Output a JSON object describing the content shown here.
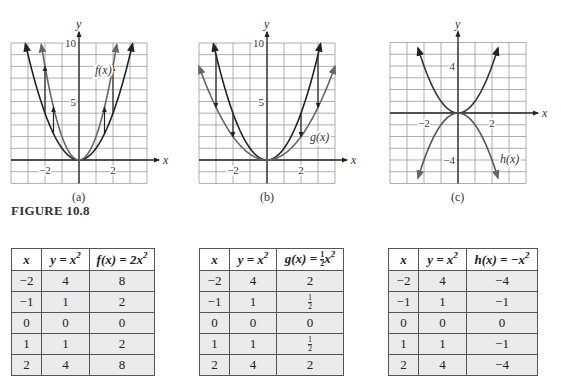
{
  "figure_label": "FIGURE 10.8",
  "captions": {
    "a": "(a)",
    "b": "(b)",
    "c": "(c)"
  },
  "graphs": {
    "a": {
      "x_axis_label": "x",
      "y_axis_label": "y",
      "x_ticks": [
        "−2",
        "2"
      ],
      "y_ticks": [
        "5",
        "10"
      ],
      "curve_label": "f(x)"
    },
    "b": {
      "x_axis_label": "x",
      "y_axis_label": "y",
      "x_ticks": [
        "−2",
        "2"
      ],
      "y_ticks": [
        "5",
        "10"
      ],
      "curve_label": "g(x)"
    },
    "c": {
      "x_axis_label": "x",
      "y_axis_label": "y",
      "x_ticks": [
        "−2",
        "2"
      ],
      "y_ticks": [
        "4",
        "−4"
      ],
      "curve_label": "h(x)"
    }
  },
  "tables": {
    "a": {
      "headers": [
        "x",
        "y = x²",
        "f(x) = 2x²"
      ],
      "rows": [
        [
          "−2",
          "4",
          "8"
        ],
        [
          "−1",
          "1",
          "2"
        ],
        [
          "0",
          "0",
          "0"
        ],
        [
          "1",
          "1",
          "2"
        ],
        [
          "2",
          "4",
          "8"
        ]
      ]
    },
    "b": {
      "headers": [
        "x",
        "y = x²",
        "g(x) = ½x²"
      ],
      "rows": [
        [
          "−2",
          "4",
          "2"
        ],
        [
          "−1",
          "1",
          "½"
        ],
        [
          "0",
          "0",
          "0"
        ],
        [
          "1",
          "1",
          "½"
        ],
        [
          "2",
          "4",
          "2"
        ]
      ]
    },
    "c": {
      "headers": [
        "x",
        "y = x²",
        "h(x) = −x²"
      ],
      "rows": [
        [
          "−2",
          "4",
          "−4"
        ],
        [
          "−1",
          "1",
          "−1"
        ],
        [
          "0",
          "0",
          "0"
        ],
        [
          "1",
          "1",
          "−1"
        ],
        [
          "2",
          "4",
          "−4"
        ]
      ]
    }
  },
  "chart_data": [
    {
      "type": "line",
      "title": "(a)",
      "xlabel": "x",
      "ylabel": "y",
      "xlim": [
        -4,
        4
      ],
      "ylim": [
        -2,
        10
      ],
      "grid": true,
      "series": [
        {
          "name": "y = x^2",
          "x": [
            -3.2,
            -3,
            -2,
            -1,
            0,
            1,
            2,
            3,
            3.2
          ],
          "values": [
            10.24,
            9,
            4,
            1,
            0,
            1,
            4,
            9,
            10.24
          ]
        },
        {
          "name": "f(x) = 2x^2",
          "x": [
            -2.24,
            -2,
            -1,
            0,
            1,
            2,
            2.24
          ],
          "values": [
            10,
            8,
            2,
            0,
            2,
            8,
            10
          ]
        }
      ],
      "annotations": [
        "f(x)",
        "arrows from y=x^2 up to 2x^2 at x=±1 and x=±2"
      ]
    },
    {
      "type": "line",
      "title": "(b)",
      "xlabel": "x",
      "ylabel": "y",
      "xlim": [
        -4,
        4
      ],
      "ylim": [
        -2,
        10
      ],
      "grid": true,
      "series": [
        {
          "name": "y = x^2",
          "x": [
            -3.1,
            -3,
            -2,
            -1,
            0,
            1,
            2,
            3,
            3.1
          ],
          "values": [
            9.6,
            9,
            4,
            1,
            0,
            1,
            4,
            9,
            9.6
          ]
        },
        {
          "name": "g(x) = 1/2 x^2",
          "x": [
            -4,
            -3,
            -2,
            -1,
            0,
            1,
            2,
            3,
            4
          ],
          "values": [
            8,
            4.5,
            2,
            0.5,
            0,
            0.5,
            2,
            4.5,
            8
          ]
        }
      ],
      "annotations": [
        "g(x)",
        "arrows from y=x^2 down to x^2/2 at x=±2 and x=±3"
      ]
    },
    {
      "type": "line",
      "title": "(c)",
      "xlabel": "x",
      "ylabel": "y",
      "xlim": [
        -4,
        4
      ],
      "ylim": [
        -6,
        6
      ],
      "grid": true,
      "series": [
        {
          "name": "y = x^2",
          "x": [
            -2.4,
            -2,
            -1,
            0,
            1,
            2,
            2.4
          ],
          "values": [
            5.76,
            4,
            1,
            0,
            1,
            4,
            5.76
          ]
        },
        {
          "name": "h(x) = -x^2",
          "x": [
            -2.4,
            -2,
            -1,
            0,
            1,
            2,
            2.4
          ],
          "values": [
            -5.76,
            -4,
            -1,
            0,
            -1,
            -4,
            -5.76
          ]
        }
      ],
      "annotations": [
        "h(x)"
      ]
    }
  ]
}
